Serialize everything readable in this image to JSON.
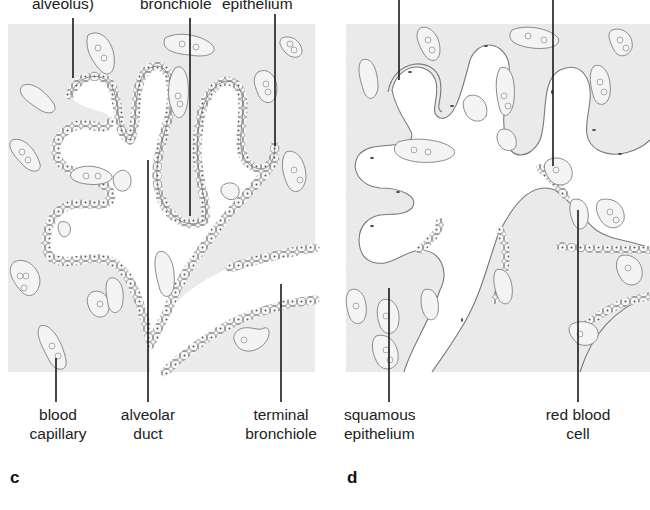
{
  "figure": {
    "type": "histology-diagram",
    "panels": [
      {
        "id": "c",
        "letter": "c",
        "top_labels": [
          {
            "text_visible": "alveolus)",
            "leader_x": 73
          },
          {
            "text_visible": "bronchiole",
            "leader_x": 190
          },
          {
            "text_visible": "epithelium",
            "leader_x": 275
          }
        ],
        "bottom_labels": [
          {
            "line1": "blood",
            "line2": "capillary",
            "leader_x": 56
          },
          {
            "line1": "alveolar",
            "line2": "duct",
            "leader_x": 148
          },
          {
            "line1": "terminal",
            "line2": "bronchiole",
            "leader_x": 281
          }
        ]
      },
      {
        "id": "d",
        "letter": "d",
        "top_labels": [
          {
            "text_visible": "",
            "leader_x": 399
          },
          {
            "text_visible": "",
            "leader_x": 553
          }
        ],
        "bottom_labels": [
          {
            "line1": "squamous",
            "line2": "epithelium",
            "leader_x": 389
          },
          {
            "line1": "red blood",
            "line2": "cell",
            "leader_x": 578
          }
        ]
      }
    ],
    "colors": {
      "tissue_background": "#ececec",
      "lumen": "#ffffff",
      "outline": "#8a8a8a",
      "leader_line": "#1a1a1a",
      "text": "#222222"
    }
  }
}
